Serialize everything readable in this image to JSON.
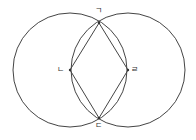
{
  "diagram": {
    "stroke_color": "#444444",
    "background": "#ffffff",
    "circles": [
      {
        "name": "left-circle",
        "cx": 70,
        "cy": 70,
        "r": 57
      },
      {
        "name": "right-circle",
        "cx": 128,
        "cy": 70,
        "r": 57
      }
    ],
    "points": [
      {
        "label": "ㄱ",
        "x": 99,
        "y": 23,
        "role": "top-intersection"
      },
      {
        "label": "ㄴ",
        "x": 70,
        "y": 70,
        "role": "left-circle-center"
      },
      {
        "label": "ㄷ",
        "x": 99,
        "y": 118,
        "role": "bottom-intersection"
      },
      {
        "label": "ㄹ",
        "x": 128,
        "y": 70,
        "role": "right-circle-center"
      }
    ],
    "labels": {
      "top": "ㄱ",
      "left": "ㄴ",
      "bottom": "ㄷ",
      "right": "ㄹ"
    },
    "polygon": [
      "ㄱ",
      "ㄹ",
      "ㄷ",
      "ㄴ"
    ]
  }
}
